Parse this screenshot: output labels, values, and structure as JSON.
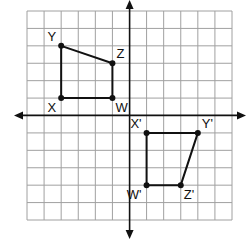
{
  "diagram": {
    "type": "coordinate-plane-transformation",
    "grid": {
      "xmin": -6,
      "xmax": 6,
      "ymin": -6,
      "ymax": 6,
      "step": 1
    },
    "colors": {
      "grid": "#a0a0a0",
      "axis": "#111111",
      "shape": "#111111",
      "point": "#111111"
    },
    "preimage": {
      "name": "WXYZ",
      "vertices": [
        {
          "label": "Y",
          "x": -4,
          "y": 4,
          "anchor": "upper-left"
        },
        {
          "label": "Z",
          "x": -1,
          "y": 3,
          "anchor": "upper-right"
        },
        {
          "label": "W",
          "x": -1,
          "y": 1,
          "anchor": "lower-right"
        },
        {
          "label": "X",
          "x": -4,
          "y": 1,
          "anchor": "lower-left"
        }
      ]
    },
    "image": {
      "name": "W'X'Y'Z'",
      "vertices": [
        {
          "label": "X'",
          "x": 1,
          "y": -1,
          "anchor": "upper-left"
        },
        {
          "label": "Y'",
          "x": 4,
          "y": -1,
          "anchor": "upper-right"
        },
        {
          "label": "Z'",
          "x": 3,
          "y": -4,
          "anchor": "lower-right"
        },
        {
          "label": "W'",
          "x": 1,
          "y": -4,
          "anchor": "lower-left"
        }
      ]
    }
  }
}
